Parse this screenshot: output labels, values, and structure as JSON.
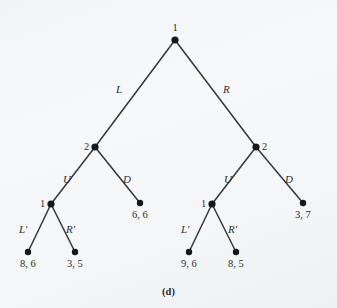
{
  "figure": {
    "caption": "(d)",
    "background_color": "#f4f6f8",
    "ink_color": "#2a2d30"
  },
  "chart_data": {
    "type": "diagram",
    "diagram_type": "extensive-form-game-tree",
    "title": "(d)",
    "nodes": [
      {
        "id": "root",
        "label": "1",
        "x": 175,
        "y": 40,
        "kind": "decision",
        "label_pos": "above"
      },
      {
        "id": "n2L",
        "label": "2",
        "x": 95,
        "y": 147,
        "kind": "decision",
        "label_pos": "left"
      },
      {
        "id": "n2R",
        "label": "2",
        "x": 256,
        "y": 147,
        "kind": "decision",
        "label_pos": "right"
      },
      {
        "id": "n1L",
        "label": "1",
        "x": 51,
        "y": 204,
        "kind": "decision",
        "label_pos": "left"
      },
      {
        "id": "n1R",
        "label": "1",
        "x": 212,
        "y": 204,
        "kind": "decision",
        "label_pos": "left"
      },
      {
        "id": "t1",
        "label": "8, 6",
        "x": 28,
        "y": 252,
        "kind": "terminal",
        "label_pos": "below"
      },
      {
        "id": "t2",
        "label": "3, 5",
        "x": 75,
        "y": 252,
        "kind": "terminal",
        "label_pos": "below"
      },
      {
        "id": "t3",
        "label": "6, 6",
        "x": 140,
        "y": 203,
        "kind": "terminal",
        "label_pos": "below"
      },
      {
        "id": "t4",
        "label": "9, 6",
        "x": 189,
        "y": 252,
        "kind": "terminal",
        "label_pos": "below"
      },
      {
        "id": "t5",
        "label": "8, 5",
        "x": 236,
        "y": 252,
        "kind": "terminal",
        "label_pos": "below"
      },
      {
        "id": "t6",
        "label": "3, 7",
        "x": 303,
        "y": 203,
        "kind": "terminal",
        "label_pos": "below"
      }
    ],
    "edges": [
      {
        "from": "root",
        "to": "n2L",
        "label": "L",
        "label_x": 116,
        "label_y": 84
      },
      {
        "from": "root",
        "to": "n2R",
        "label": "R",
        "label_x": 223,
        "label_y": 84
      },
      {
        "from": "n2L",
        "to": "n1L",
        "label": "U",
        "label_x": 63,
        "label_y": 174
      },
      {
        "from": "n2L",
        "to": "t3",
        "label": "D",
        "label_x": 123,
        "label_y": 174
      },
      {
        "from": "n2R",
        "to": "n1R",
        "label": "U",
        "label_x": 224,
        "label_y": 174
      },
      {
        "from": "n2R",
        "to": "t6",
        "label": "D",
        "label_x": 285,
        "label_y": 174
      },
      {
        "from": "n1L",
        "to": "t1",
        "label": "L'",
        "label_x": 19,
        "label_y": 224
      },
      {
        "from": "n1L",
        "to": "t2",
        "label": "R'",
        "label_x": 66,
        "label_y": 224
      },
      {
        "from": "n1R",
        "to": "t4",
        "label": "L'",
        "label_x": 181,
        "label_y": 224
      },
      {
        "from": "n1R",
        "to": "t5",
        "label": "R'",
        "label_x": 228,
        "label_y": 224
      }
    ],
    "players": [
      "1",
      "2"
    ],
    "payoffs": {
      "L,U,L'": "8, 6",
      "L,U,R'": "3, 5",
      "L,D": "6, 6",
      "R,U,L'": "9, 6",
      "R,U,R'": "8, 5",
      "R,D": "3, 7"
    },
    "actions": {
      "player1_root": [
        "L",
        "R"
      ],
      "player2": [
        "U",
        "D"
      ],
      "player1_second": [
        "L'",
        "R'"
      ]
    }
  }
}
